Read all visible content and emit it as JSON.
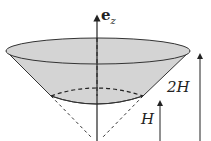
{
  "figure": {
    "labels": {
      "axis": "e",
      "axis_subscript": "z",
      "total_height": "2H",
      "bottom_height": "H"
    },
    "colors": {
      "fill": "#d4d4d4",
      "stroke": "#333333",
      "background": "#ffffff"
    }
  }
}
